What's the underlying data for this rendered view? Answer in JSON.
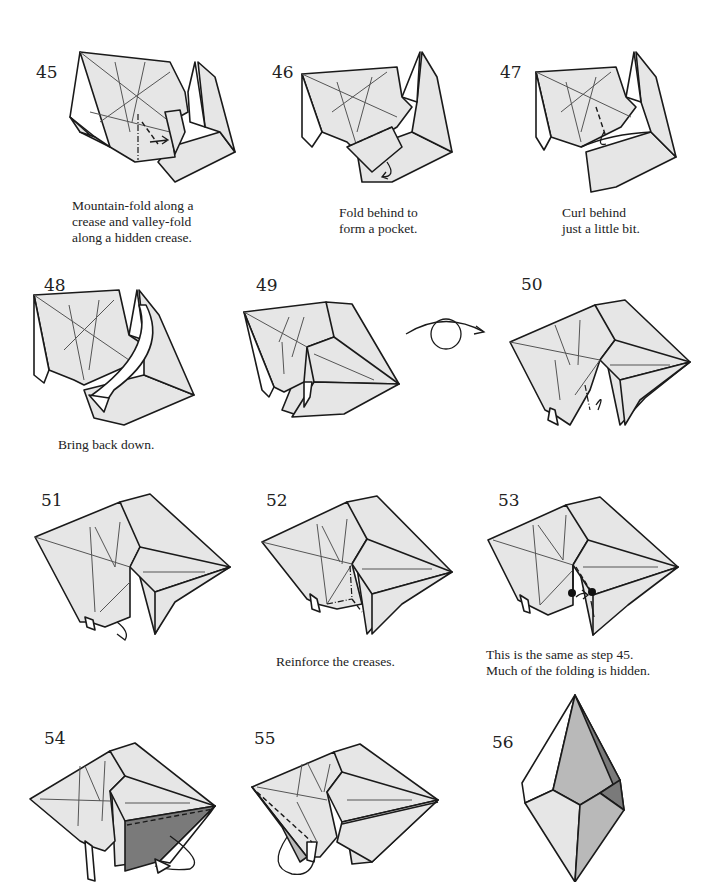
{
  "page": {
    "background": "#ffffff",
    "colors": {
      "paper_front": "#e6e6e6",
      "paper_back": "#ffffff",
      "shaded_dark": "#7a7a7a",
      "shaded_mid": "#b9b9b9",
      "line": "#1a1a1a"
    }
  },
  "steps": [
    {
      "number": "45",
      "caption": "Mountain-fold along a\ncrease and valley-fold\nalong a hidden crease.",
      "symbols": [
        "mountain-fold-line",
        "valley-fold-line",
        "fold-arrow"
      ]
    },
    {
      "number": "46",
      "caption": "Fold behind to\nform a pocket.",
      "symbols": [
        "mountain-fold-line",
        "fold-behind-arrow"
      ]
    },
    {
      "number": "47",
      "caption": "Curl behind\njust a little bit.",
      "symbols": [
        "valley-fold-line",
        "curl-arrow"
      ]
    },
    {
      "number": "48",
      "caption": "Bring back down.",
      "symbols": [
        "unfold-arrow"
      ]
    },
    {
      "number": "49",
      "caption": "",
      "symbols": [
        "turn-over-arrow"
      ]
    },
    {
      "number": "50",
      "caption": "",
      "symbols": [
        "mountain-fold-line",
        "push-in-arrow"
      ]
    },
    {
      "number": "51",
      "caption": "",
      "symbols": [
        "push-in-arrow"
      ]
    },
    {
      "number": "52",
      "caption": "Reinforce the creases.",
      "symbols": [
        "mountain-fold-line",
        "valley-fold-line"
      ]
    },
    {
      "number": "53",
      "caption": "This is the same as step 45.\nMuch of the folding is hidden.",
      "symbols": [
        "reference-dots",
        "valley-fold-line",
        "fold-arrow"
      ]
    },
    {
      "number": "54",
      "caption": "",
      "symbols": [
        "valley-fold-line",
        "fold-behind-arrow"
      ]
    },
    {
      "number": "55",
      "caption": "",
      "symbols": [
        "valley-fold-line",
        "fold-behind-arrow"
      ]
    },
    {
      "number": "56",
      "caption": "",
      "symbols": [
        "finished-model"
      ]
    }
  ]
}
